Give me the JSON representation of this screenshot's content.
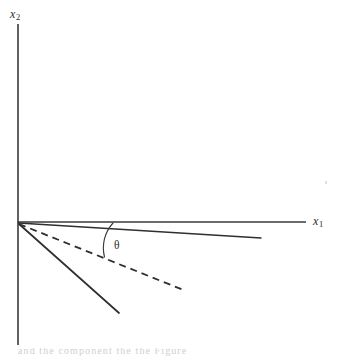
{
  "figure": {
    "kind": "vector-angle-diagram",
    "background_color": "#ffffff",
    "ink_color": "#2b2b2b",
    "width": 345,
    "height": 358
  },
  "axes": {
    "origin": {
      "x": 18,
      "y": 222
    },
    "x_axis": {
      "label": "x",
      "subscript": "1",
      "label_x": 313,
      "label_y": 214,
      "from": {
        "x": 18,
        "y": 222
      },
      "to": {
        "x": 306,
        "y": 222
      }
    },
    "y_axis": {
      "label": "x",
      "subscript": "2",
      "label_x": 10,
      "label_y": 8,
      "from": {
        "x": 18,
        "y": 24
      },
      "to": {
        "x": 18,
        "y": 345
      }
    }
  },
  "rays": [
    {
      "name": "upper-solid-ray",
      "style": "solid",
      "from": {
        "x": 18,
        "y": 223
      },
      "to": {
        "x": 261,
        "y": 238
      }
    },
    {
      "name": "dashed-ray",
      "style": "dashed",
      "from": {
        "x": 19,
        "y": 224
      },
      "to": {
        "x": 186,
        "y": 291
      }
    },
    {
      "name": "lower-solid-ray",
      "style": "solid",
      "from": {
        "x": 19,
        "y": 224
      },
      "to": {
        "x": 119,
        "y": 313
      }
    }
  ],
  "angle_arc": {
    "label": "θ",
    "label_x": 114,
    "label_y": 240,
    "start": {
      "x": 113,
      "y": 223
    },
    "end": {
      "x": 104,
      "y": 257
    },
    "radius": 36
  },
  "artifacts": {
    "speck": {
      "x": 325,
      "y": 181
    },
    "caption_remnant": "and the component the the  Figure"
  }
}
